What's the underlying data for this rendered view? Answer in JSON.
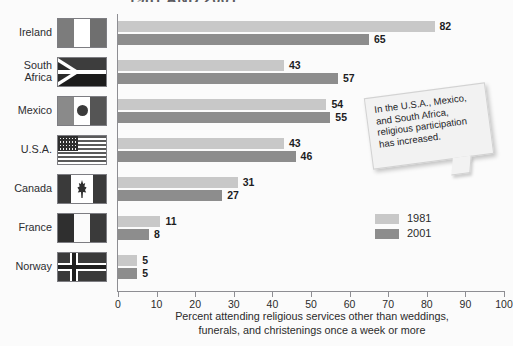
{
  "title": "1981 AND 2001",
  "chart_data": {
    "type": "bar",
    "orientation": "horizontal",
    "title": "1981 AND 2001",
    "categories": [
      "Ireland",
      "South Africa",
      "Mexico",
      "U.S.A.",
      "Canada",
      "France",
      "Norway"
    ],
    "series": [
      {
        "name": "1981",
        "color": "#c8c8c8",
        "values": [
          82,
          43,
          54,
          43,
          31,
          11,
          5
        ]
      },
      {
        "name": "2001",
        "color": "#8d8d8d",
        "values": [
          65,
          57,
          55,
          46,
          27,
          8,
          5
        ]
      }
    ],
    "xlabel": "Percent attending religious services other than weddings, funerals, and christenings once a week or more",
    "ylabel": "",
    "xlim": [
      0,
      100
    ],
    "xticks": [
      0,
      10,
      20,
      30,
      40,
      50,
      60,
      70,
      80,
      90,
      100
    ],
    "grid": false,
    "legend_position": "inside-right",
    "annotations": [
      "In the U.S.A., Mexico, and South Africa, religious participation has increased."
    ]
  },
  "axis": {
    "caption_line1": "Percent attending religious services other than weddings,",
    "caption_line2": "funerals, and christenings once a week or more",
    "ticks": [
      "0",
      "10",
      "20",
      "30",
      "40",
      "50",
      "60",
      "70",
      "80",
      "90",
      "100"
    ]
  },
  "legend": {
    "items": [
      {
        "label": "1981",
        "color": "#c8c8c8"
      },
      {
        "label": "2001",
        "color": "#8d8d8d"
      }
    ]
  },
  "callout": {
    "line1": "In the U.S.A., Mexico,",
    "line2": "and South Africa,",
    "line3": "religious participation",
    "line4": "has increased."
  },
  "rows": [
    {
      "country": "Ireland",
      "flag": "flag-ireland",
      "v1981": "82",
      "v2001": "65"
    },
    {
      "country": "South Africa",
      "flag": "flag-south-africa",
      "v1981": "43",
      "v2001": "57"
    },
    {
      "country": "Mexico",
      "flag": "flag-mexico",
      "v1981": "54",
      "v2001": "55"
    },
    {
      "country": "U.S.A.",
      "flag": "flag-usa",
      "v1981": "43",
      "v2001": "46"
    },
    {
      "country": "Canada",
      "flag": "flag-canada",
      "v1981": "31",
      "v2001": "27"
    },
    {
      "country": "France",
      "flag": "flag-france",
      "v1981": "11",
      "v2001": "8"
    },
    {
      "country": "Norway",
      "flag": "flag-norway",
      "v1981": "5",
      "v2001": "5"
    }
  ]
}
